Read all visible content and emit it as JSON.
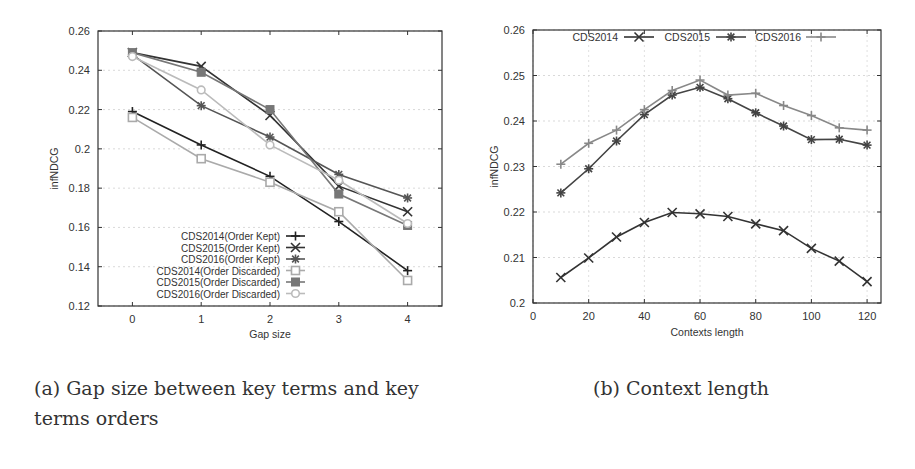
{
  "captions": {
    "a": "(a) Gap size between key terms and key terms orders",
    "b": "(b) Context length"
  },
  "chart_data": [
    {
      "type": "line",
      "id": "a",
      "title": "",
      "xlabel": "Gap size",
      "ylabel": "infNDCG",
      "x": [
        0,
        1,
        2,
        3,
        4
      ],
      "xticks": [
        "0",
        "1",
        "2",
        "3",
        "4"
      ],
      "xlim": [
        -0.5,
        4.5
      ],
      "ylim": [
        0.12,
        0.26
      ],
      "yticks": [
        "0.12",
        "0.14",
        "0.16",
        "0.18",
        "0.2",
        "0.22",
        "0.24",
        "0.26"
      ],
      "grid": true,
      "legend_position": "lower left inside",
      "series": [
        {
          "name": "CDS2014(Order Kept)",
          "values": [
            0.219,
            0.202,
            0.186,
            0.163,
            0.138
          ],
          "color": "#222222",
          "marker": "plus"
        },
        {
          "name": "CDS2015(Order Kept)",
          "values": [
            0.249,
            0.242,
            0.217,
            0.181,
            0.168
          ],
          "color": "#333333",
          "marker": "x"
        },
        {
          "name": "CDS2016(Order Kept)",
          "values": [
            0.248,
            0.222,
            0.206,
            0.187,
            0.175
          ],
          "color": "#555555",
          "marker": "star"
        },
        {
          "name": "CDS2014(Order Discarded)",
          "values": [
            0.216,
            0.195,
            0.183,
            0.168,
            0.133
          ],
          "color": "#aaaaaa",
          "marker": "open-square"
        },
        {
          "name": "CDS2015(Order Discarded)",
          "values": [
            0.249,
            0.239,
            0.22,
            0.177,
            0.161
          ],
          "color": "#777777",
          "marker": "filled-square"
        },
        {
          "name": "CDS2016(Order Discarded)",
          "values": [
            0.247,
            0.23,
            0.202,
            0.184,
            0.162
          ],
          "color": "#bbbbbb",
          "marker": "open-circle"
        }
      ]
    },
    {
      "type": "line",
      "id": "b",
      "title": "",
      "xlabel": "Contexts length",
      "ylabel": "infNDCG",
      "x": [
        10,
        20,
        30,
        40,
        50,
        60,
        70,
        80,
        90,
        100,
        110,
        120
      ],
      "xticks": [
        "0",
        "20",
        "40",
        "60",
        "80",
        "100",
        "120"
      ],
      "xlim": [
        0,
        125
      ],
      "ylim": [
        0.2,
        0.26
      ],
      "yticks": [
        "0.2",
        "0.21",
        "0.22",
        "0.23",
        "0.24",
        "0.25",
        "0.26"
      ],
      "grid": true,
      "legend_position": "top inside, horizontal",
      "series": [
        {
          "name": "CDS2014",
          "values": [
            0.2056,
            0.2099,
            0.2145,
            0.2177,
            0.2199,
            0.2196,
            0.219,
            0.2174,
            0.2159,
            0.212,
            0.2092,
            0.2047
          ],
          "color": "#333333",
          "marker": "x"
        },
        {
          "name": "CDS2015",
          "values": [
            0.2242,
            0.2295,
            0.2356,
            0.2414,
            0.2457,
            0.2474,
            0.2449,
            0.2418,
            0.2389,
            0.2359,
            0.236,
            0.2347
          ],
          "color": "#444444",
          "marker": "star"
        },
        {
          "name": "CDS2016",
          "values": [
            0.2305,
            0.2351,
            0.238,
            0.2425,
            0.2467,
            0.249,
            0.2457,
            0.2461,
            0.2434,
            0.2412,
            0.2385,
            0.238
          ],
          "color": "#888888",
          "marker": "plus"
        }
      ]
    }
  ]
}
